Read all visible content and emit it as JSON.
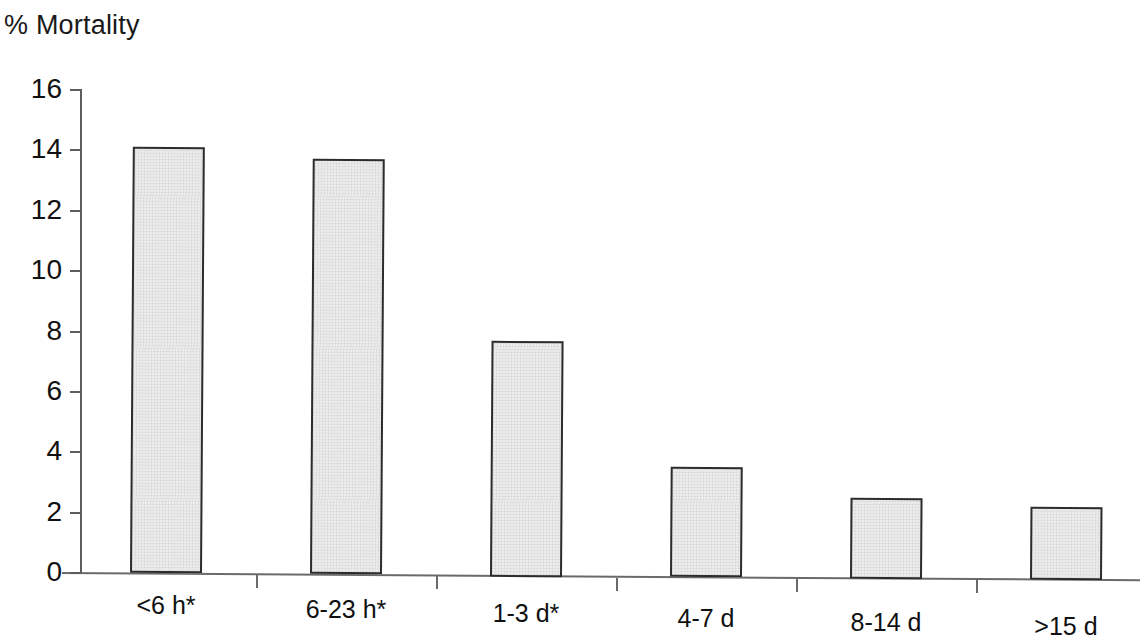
{
  "chart_data": {
    "type": "bar",
    "title": "% Mortality",
    "xlabel": "",
    "ylabel": "",
    "ylim": [
      0,
      16
    ],
    "ytick_step": 2,
    "grid": false,
    "legend": null,
    "categories": [
      "<6 h*",
      "6-23 h*",
      "1-3 d*",
      "4-7 d",
      "8-14 d",
      ">15 d"
    ],
    "values": [
      14.1,
      13.7,
      7.7,
      3.5,
      2.5,
      2.2
    ],
    "ytick_labels": [
      "16",
      "14",
      "12",
      "10",
      "8",
      "6",
      "4",
      "2",
      "0"
    ],
    "ytick_values": [
      16,
      14,
      12,
      10,
      8,
      6,
      4,
      2,
      0
    ],
    "bar_fill_color": "#ececec",
    "bar_border_color": "#2c2c2c",
    "axis_color": "#5d5d5d",
    "text_color": "#111111"
  }
}
